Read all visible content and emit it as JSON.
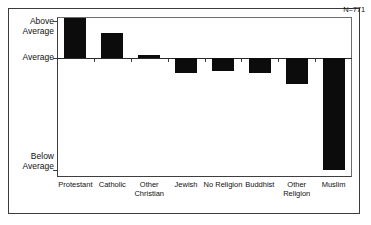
{
  "chart_data": {
    "type": "bar",
    "title": "",
    "subtitle": "",
    "xlabel": "",
    "ylabel": "",
    "orientation": "vertical",
    "grid": false,
    "legend": false,
    "baseline_label": "Average",
    "categories": [
      "Protestant",
      "Catholic",
      "Other Christian",
      "Jewish",
      "No Religion",
      "Buddhist",
      "Other Religion",
      "Muslim"
    ],
    "category_label_lines": [
      [
        "Protestant"
      ],
      [
        "Catholic"
      ],
      [
        "Other",
        "Christian"
      ],
      [
        "Jewish"
      ],
      [
        "No Religion"
      ],
      [
        "Buddhist"
      ],
      [
        "Other",
        "Religion"
      ],
      [
        "Muslim"
      ]
    ],
    "values": [
      0.36,
      0.22,
      0.03,
      -0.13,
      -0.12,
      -0.13,
      -0.23,
      -1.0
    ],
    "value_units": "relative to Average (1.0 = Below Average tick)",
    "ylim": [
      -1.0,
      0.38
    ],
    "ytick_labels": [
      "Above Average",
      "Average",
      "Below Average"
    ],
    "ytick_label_lines": [
      [
        "Above",
        "Average"
      ],
      [
        "Average"
      ],
      [
        "Below",
        "Average"
      ]
    ],
    "annotations": [
      {
        "text": "N=771",
        "position": "top-right"
      }
    ],
    "colors": {
      "bar": "#0c0c0c",
      "axis": "#3f3f3f",
      "frame": "#6e6e6e",
      "outer_border": "#3b3b3b",
      "background": "#ffffff",
      "text": "#111111"
    }
  },
  "axis": {
    "y_above": "Above\nAverage",
    "y_average": "Average",
    "y_below": "Below\nAverage"
  },
  "note": {
    "n_text": "N=771"
  }
}
